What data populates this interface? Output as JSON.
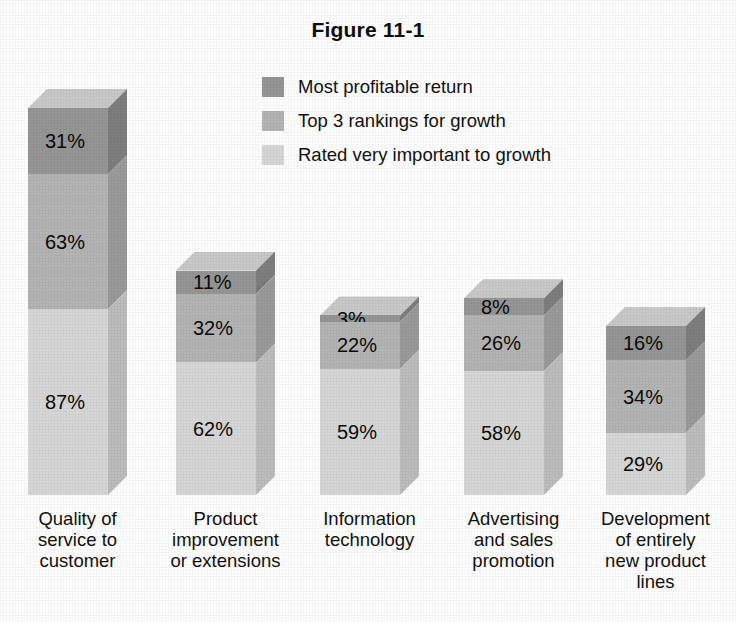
{
  "chart_data": {
    "type": "bar",
    "subtype": "stacked-column-3d",
    "title": "Figure 11-1",
    "xlabel": "",
    "ylabel": "",
    "grid": false,
    "legend_position": "top-center",
    "value_suffix": "%",
    "ylim": [
      0,
      181
    ],
    "categories": [
      "Quality of service to customer",
      "Product improvement or extensions",
      "Information technology",
      "Advertising and sales promotion",
      "Development of entirely new product lines"
    ],
    "category_lines": [
      [
        "Quality of",
        "service to",
        "customer"
      ],
      [
        "Product",
        "improvement",
        "or extensions"
      ],
      [
        "Information",
        "technology"
      ],
      [
        "Advertising",
        "and sales",
        "promotion"
      ],
      [
        "Development",
        "of entirely",
        "new product",
        "lines"
      ]
    ],
    "series": [
      {
        "name": "Most profitable return",
        "color": "#969696",
        "values": [
          31,
          11,
          3,
          8,
          16
        ],
        "labels": [
          "31%",
          "11%",
          "3%",
          "8%",
          "16%"
        ]
      },
      {
        "name": "Top 3 rankings for growth",
        "color": "#b5b5b5",
        "values": [
          63,
          32,
          22,
          26,
          34
        ],
        "labels": [
          "63%",
          "32%",
          "22%",
          "26%",
          "34%"
        ]
      },
      {
        "name": "Rated very important to growth",
        "color": "#d7d7d7",
        "values": [
          87,
          62,
          59,
          58,
          29
        ],
        "labels": [
          "87%",
          "62%",
          "59%",
          "58%",
          "29%"
        ]
      }
    ],
    "stack_totals": [
      181,
      105,
      84,
      92,
      79
    ]
  },
  "legend": {
    "items": [
      {
        "label": "Most profitable return",
        "swatch": "#969696"
      },
      {
        "label": "Top 3 rankings for growth",
        "swatch": "#b5b5b5"
      },
      {
        "label": "Rated very important to growth",
        "swatch": "#d7d7d7"
      }
    ]
  },
  "palette": {
    "background": "#ffffff",
    "text": "#111111",
    "dark": "#969696",
    "medium": "#b5b5b5",
    "light": "#d7d7d7",
    "dark_side": "#7e7e7e",
    "medium_side": "#9b9b9b",
    "light_side": "#bdbdbd",
    "top_face": "#c9c9c9"
  }
}
